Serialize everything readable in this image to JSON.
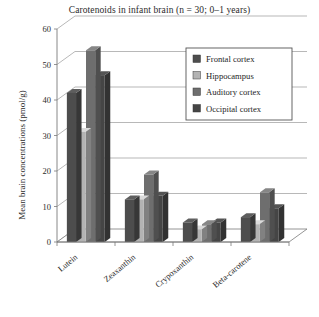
{
  "chart_data": {
    "type": "bar",
    "title": "Carotenoids in infant brain (n = 30; 0–1 years)",
    "xlabel": "",
    "ylabel": "Mean brain concentrations (pmol/g)",
    "categories": [
      "Lutein",
      "Zeaxanthin",
      "Crypoxanthin",
      "Beta-carotene"
    ],
    "series": [
      {
        "name": "Frontal cortex",
        "color": "#4d4d4d",
        "values": [
          42,
          12,
          5.5,
          7
        ]
      },
      {
        "name": "Hippocampus",
        "color": "#b3b3b3",
        "values": [
          31,
          12,
          3.5,
          5
        ]
      },
      {
        "name": "Auditory cortex",
        "color": "#6e6e6e",
        "values": [
          54,
          19,
          5,
          14
        ]
      },
      {
        "name": "Occipital cortex",
        "color": "#454545",
        "values": [
          47,
          13,
          5.5,
          9.5
        ]
      }
    ],
    "ylim": [
      0,
      60
    ],
    "yticks": [
      0,
      10,
      20,
      30,
      40,
      50,
      60
    ],
    "ytick_labels": [
      "0",
      "10",
      "20",
      "30",
      "40",
      "50",
      "60"
    ],
    "grid": true,
    "legend_position": "upper right",
    "projection": "3d-perspective"
  },
  "legend": {
    "items": [
      {
        "label": "Frontal cortex",
        "swatch": "#4d4d4d"
      },
      {
        "label": "Hippocampus",
        "swatch": "#b3b3b3"
      },
      {
        "label": "Auditory cortex",
        "swatch": "#6e6e6e"
      },
      {
        "label": "Occipital cortex",
        "swatch": "#454545"
      }
    ]
  }
}
